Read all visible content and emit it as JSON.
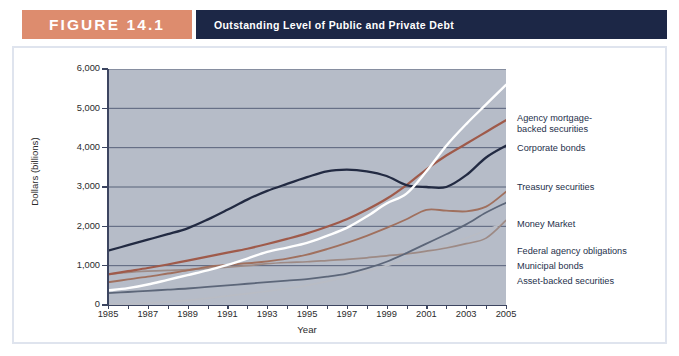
{
  "header": {
    "figure_label": "FIGURE 14.1",
    "title": "Outstanding Level of Public and Private Debt",
    "figure_box_color": "#dd8c6e",
    "title_bar_color": "#1c2746"
  },
  "chart_data": {
    "type": "line",
    "title": "Outstanding Level of Public and Private Debt",
    "xlabel": "Year",
    "ylabel": "Dollars (billions)",
    "xlim": [
      1985,
      2005
    ],
    "ylim": [
      0,
      6000
    ],
    "yticks": [
      "0",
      "1,000",
      "2,000",
      "3,000",
      "4,000",
      "5,000",
      "6,000"
    ],
    "xticks": [
      "1985",
      "1987",
      "1989",
      "1991",
      "1993",
      "1995",
      "1997",
      "1999",
      "2001",
      "2003",
      "2005"
    ],
    "grid": true,
    "grid_axis": "y",
    "plot_background": "#b6bcc8",
    "legend_position": "right-inline",
    "x": [
      1985,
      1986,
      1987,
      1988,
      1989,
      1990,
      1991,
      1992,
      1993,
      1994,
      1995,
      1996,
      1997,
      1998,
      1999,
      2000,
      2001,
      2002,
      2003,
      2004,
      2005
    ],
    "series": [
      {
        "name": "Agency mortgage-backed securities",
        "label": "Agency mortgage-\nbacked securities",
        "color": "#ffffff",
        "width": 2.4,
        "values": [
          370,
          430,
          520,
          640,
          760,
          880,
          1020,
          1180,
          1350,
          1460,
          1580,
          1760,
          1960,
          2250,
          2580,
          2830,
          3400,
          4050,
          4600,
          5100,
          5600
        ]
      },
      {
        "name": "Corporate bonds",
        "label": "Corporate bonds",
        "color": "#9f5a4a",
        "width": 2.2,
        "values": [
          780,
          860,
          940,
          1030,
          1130,
          1230,
          1330,
          1430,
          1550,
          1680,
          1820,
          1990,
          2180,
          2420,
          2700,
          3050,
          3450,
          3800,
          4100,
          4400,
          4700
        ]
      },
      {
        "name": "Treasury securities",
        "label": "Treasury securities",
        "color": "#222a42",
        "width": 2.3,
        "values": [
          1380,
          1520,
          1660,
          1800,
          1950,
          2170,
          2420,
          2680,
          2900,
          3080,
          3250,
          3400,
          3440,
          3400,
          3280,
          3050,
          3000,
          3000,
          3300,
          3750,
          4050
        ]
      },
      {
        "name": "Money Market",
        "label": "Money Market",
        "color": "#a0705e",
        "width": 1.9,
        "values": [
          580,
          650,
          720,
          800,
          880,
          970,
          1020,
          1060,
          1110,
          1180,
          1280,
          1420,
          1580,
          1760,
          1960,
          2180,
          2420,
          2400,
          2380,
          2500,
          2880
        ]
      },
      {
        "name": "Federal agency obligations",
        "label": "Federal agency obligations",
        "color": "#5c6679",
        "width": 1.8,
        "values": [
          300,
          330,
          360,
          390,
          420,
          460,
          500,
          540,
          580,
          620,
          660,
          720,
          800,
          930,
          1100,
          1320,
          1560,
          1800,
          2050,
          2350,
          2600
        ]
      },
      {
        "name": "Municipal bonds",
        "label": "Municipal bonds",
        "color": "#9d8a85",
        "width": 1.7,
        "values": [
          780,
          830,
          860,
          880,
          900,
          930,
          960,
          1000,
          1050,
          1080,
          1100,
          1130,
          1160,
          1200,
          1250,
          1300,
          1370,
          1450,
          1560,
          1700,
          2150
        ]
      },
      {
        "name": "Asset-backed securities",
        "label": "Asset-backed securities",
        "color": "#b9bcc4",
        "width": 1.7,
        "values": [
          20,
          30,
          50,
          80,
          120,
          170,
          230,
          290,
          350,
          420,
          500,
          600,
          720,
          860,
          1000,
          1150,
          1320,
          1500,
          1700,
          1900,
          2100
        ]
      }
    ]
  }
}
